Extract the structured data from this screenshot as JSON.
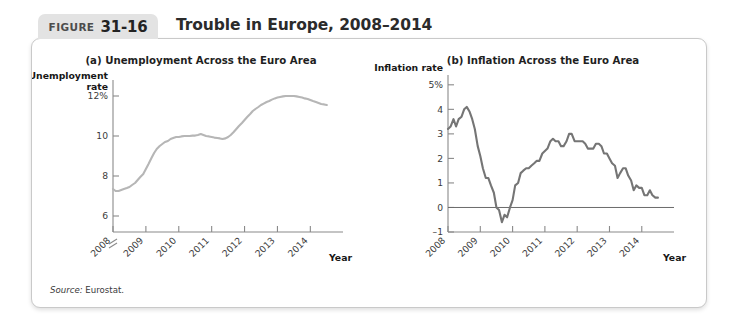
{
  "figure": {
    "badge_word": "FIGURE",
    "badge_number": "31-16",
    "title": "Trouble in Europe, 2008–2014",
    "source_label": "Source:",
    "source_value": "Eurostat."
  },
  "chart_data": [
    {
      "id": "a",
      "type": "line",
      "title": "(a) Unemployment Across the Euro Area",
      "ylabel_line1": "Unemployment",
      "ylabel_line2": "rate",
      "xlabel": "Year",
      "ytick_labels": [
        "12%",
        "10",
        "8",
        "6"
      ],
      "ytick_values": [
        12,
        10,
        8,
        6
      ],
      "xtick_labels": [
        "2008",
        "2009",
        "2010",
        "2011",
        "2012",
        "2013",
        "2014"
      ],
      "xtick_values": [
        2008,
        2009,
        2010,
        2011,
        2012,
        2013,
        2014
      ],
      "ylim": [
        5.2,
        12.8
      ],
      "xlim": [
        2008.0,
        2014.75
      ],
      "axis_break": true,
      "grid": false,
      "legend": "none",
      "line_color": "#b6b6b6",
      "series": [
        {
          "name": "Euro area unemployment rate",
          "x": [
            2008.0,
            2008.08,
            2008.17,
            2008.25,
            2008.33,
            2008.42,
            2008.5,
            2008.58,
            2008.67,
            2008.75,
            2008.83,
            2008.92,
            2009.0,
            2009.08,
            2009.17,
            2009.25,
            2009.33,
            2009.42,
            2009.5,
            2009.58,
            2009.67,
            2009.75,
            2009.83,
            2009.92,
            2010.0,
            2010.08,
            2010.17,
            2010.25,
            2010.33,
            2010.42,
            2010.5,
            2010.58,
            2010.67,
            2010.75,
            2010.83,
            2010.92,
            2011.0,
            2011.08,
            2011.17,
            2011.25,
            2011.33,
            2011.42,
            2011.5,
            2011.58,
            2011.67,
            2011.75,
            2011.83,
            2011.92,
            2012.0,
            2012.08,
            2012.17,
            2012.25,
            2012.33,
            2012.42,
            2012.5,
            2012.58,
            2012.67,
            2012.75,
            2012.83,
            2012.92,
            2013.0,
            2013.08,
            2013.17,
            2013.25,
            2013.33,
            2013.42,
            2013.5,
            2013.58,
            2013.67,
            2013.75,
            2013.83,
            2013.92,
            2014.0,
            2014.08,
            2014.17,
            2014.25,
            2014.33,
            2014.42,
            2014.5
          ],
          "y": [
            7.35,
            7.25,
            7.25,
            7.3,
            7.35,
            7.4,
            7.45,
            7.55,
            7.65,
            7.8,
            7.95,
            8.1,
            8.35,
            8.6,
            8.9,
            9.15,
            9.35,
            9.5,
            9.6,
            9.7,
            9.75,
            9.85,
            9.9,
            9.95,
            9.95,
            9.98,
            10.0,
            10.0,
            10.0,
            10.02,
            10.02,
            10.05,
            10.1,
            10.05,
            10.0,
            9.98,
            9.95,
            9.92,
            9.9,
            9.88,
            9.85,
            9.88,
            9.95,
            10.05,
            10.2,
            10.35,
            10.5,
            10.65,
            10.8,
            10.95,
            11.1,
            11.25,
            11.35,
            11.45,
            11.55,
            11.62,
            11.7,
            11.75,
            11.82,
            11.88,
            11.92,
            11.95,
            11.98,
            12.0,
            12.0,
            12.0,
            12.0,
            11.98,
            11.95,
            11.92,
            11.88,
            11.85,
            11.8,
            11.75,
            11.7,
            11.65,
            11.6,
            11.58,
            11.55
          ]
        }
      ]
    },
    {
      "id": "b",
      "type": "line",
      "title": "(b) Inflation Across the Euro Area",
      "ylabel_line1": "Inflation rate",
      "ylabel_line2": "",
      "xlabel": "Year",
      "ytick_labels": [
        "5%",
        "4",
        "3",
        "2",
        "1",
        "0",
        "–1"
      ],
      "ytick_values": [
        5,
        4,
        3,
        2,
        1,
        0,
        -1
      ],
      "xtick_labels": [
        "2008",
        "2009",
        "2010",
        "2011",
        "2012",
        "2013",
        "2014"
      ],
      "xtick_values": [
        2008,
        2009,
        2010,
        2011,
        2012,
        2013,
        2014
      ],
      "ylim": [
        -1,
        5.4
      ],
      "xlim": [
        2008.0,
        2014.75
      ],
      "axis_break": false,
      "grid": false,
      "legend": "none",
      "line_color": "#757575",
      "zero_line": true,
      "series": [
        {
          "name": "Euro area inflation rate",
          "x": [
            2008.0,
            2008.08,
            2008.17,
            2008.25,
            2008.33,
            2008.42,
            2008.5,
            2008.58,
            2008.67,
            2008.75,
            2008.83,
            2008.92,
            2009.0,
            2009.08,
            2009.17,
            2009.25,
            2009.33,
            2009.42,
            2009.5,
            2009.58,
            2009.67,
            2009.75,
            2009.83,
            2009.92,
            2010.0,
            2010.08,
            2010.17,
            2010.25,
            2010.33,
            2010.42,
            2010.5,
            2010.58,
            2010.67,
            2010.75,
            2010.83,
            2010.92,
            2011.0,
            2011.08,
            2011.17,
            2011.25,
            2011.33,
            2011.42,
            2011.5,
            2011.58,
            2011.67,
            2011.75,
            2011.83,
            2011.92,
            2012.0,
            2012.08,
            2012.17,
            2012.25,
            2012.33,
            2012.42,
            2012.5,
            2012.58,
            2012.67,
            2012.75,
            2012.83,
            2012.92,
            2013.0,
            2013.08,
            2013.17,
            2013.25,
            2013.33,
            2013.42,
            2013.5,
            2013.58,
            2013.67,
            2013.75,
            2013.83,
            2013.92,
            2014.0,
            2014.08,
            2014.17,
            2014.25,
            2014.33,
            2014.42,
            2014.5
          ],
          "y": [
            3.2,
            3.3,
            3.6,
            3.3,
            3.6,
            3.7,
            4.0,
            4.1,
            3.9,
            3.6,
            3.2,
            2.5,
            2.1,
            1.6,
            1.2,
            1.2,
            0.9,
            0.6,
            0.0,
            -0.1,
            -0.6,
            -0.3,
            -0.4,
            0.0,
            0.3,
            0.9,
            1.0,
            1.4,
            1.5,
            1.6,
            1.6,
            1.7,
            1.8,
            1.9,
            1.9,
            2.2,
            2.3,
            2.4,
            2.7,
            2.8,
            2.7,
            2.7,
            2.5,
            2.5,
            2.7,
            3.0,
            3.0,
            2.7,
            2.7,
            2.7,
            2.7,
            2.6,
            2.4,
            2.4,
            2.4,
            2.6,
            2.6,
            2.5,
            2.2,
            2.2,
            2.0,
            1.8,
            1.7,
            1.2,
            1.4,
            1.6,
            1.6,
            1.3,
            1.1,
            0.7,
            0.9,
            0.8,
            0.8,
            0.5,
            0.5,
            0.7,
            0.5,
            0.4,
            0.4
          ]
        }
      ]
    }
  ]
}
